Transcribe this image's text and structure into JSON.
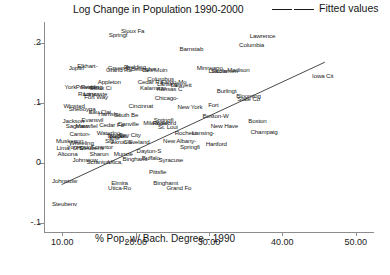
{
  "chart_data": {
    "type": "scatter",
    "title": "Log Change in Population 1990-2000",
    "xlabel": "% Pop. w/ Bach. Degree - 1990",
    "ylabel": "",
    "xlim": [
      7.5,
      52.5
    ],
    "ylim": [
      -0.115,
      0.235
    ],
    "xticks": [
      "10.00",
      "20.00",
      "30.00",
      "40.00",
      "50.00"
    ],
    "xtick_values": [
      10,
      20,
      30,
      40,
      50
    ],
    "yticks": [
      ".2",
      ".1",
      "0",
      "-.1"
    ],
    "ytick_values": [
      0.2,
      0.1,
      0,
      -0.1
    ],
    "grid": false,
    "legend_position": "top-right",
    "legend": [
      {
        "label": "Fitted values",
        "marker": "line"
      }
    ],
    "fit_line": {
      "label": "Fitted values",
      "x_start": 9.9,
      "y_start": -0.036,
      "x_end": 45.8,
      "y_end": 0.168
    },
    "point_label_field": "city",
    "points": [
      {
        "city": "Springf",
        "x": 17.6,
        "y": 0.215
      },
      {
        "city": "Sioux Fa",
        "x": 19.6,
        "y": 0.222
      },
      {
        "city": "Lawrence",
        "x": 37.3,
        "y": 0.213
      },
      {
        "city": "Columbia",
        "x": 35.8,
        "y": 0.199
      },
      {
        "city": "Barnstab",
        "x": 27.6,
        "y": 0.192
      },
      {
        "city": "Madison",
        "x": 34.0,
        "y": 0.157
      },
      {
        "city": "Iowa Cit",
        "x": 45.5,
        "y": 0.147
      },
      {
        "city": "Joplin",
        "x": 11.9,
        "y": 0.16
      },
      {
        "city": "Elkhart-",
        "x": 13.4,
        "y": 0.164
      },
      {
        "city": "Green B",
        "x": 17.7,
        "y": 0.16
      },
      {
        "city": "Grand Ra",
        "x": 17.7,
        "y": 0.156
      },
      {
        "city": "Redding",
        "x": 19.9,
        "y": 0.162
      },
      {
        "city": "Bellingha",
        "x": 21.0,
        "y": 0.159
      },
      {
        "city": "Des Moin",
        "x": 22.6,
        "y": 0.157
      },
      {
        "city": "Minneapo",
        "x": 30.1,
        "y": 0.16
      },
      {
        "city": "Lincoln",
        "x": 31.2,
        "y": 0.155
      },
      {
        "city": "Sacramen",
        "x": 32.1,
        "y": 0.155
      },
      {
        "city": "Appleton",
        "x": 16.4,
        "y": 0.136
      },
      {
        "city": "Cedar Ra",
        "x": 22.0,
        "y": 0.136
      },
      {
        "city": "Columbus",
        "x": 23.4,
        "y": 0.142
      },
      {
        "city": "Fargo-Mo",
        "x": 25.2,
        "y": 0.136
      },
      {
        "city": "Lansing",
        "x": 24.3,
        "y": 0.134
      },
      {
        "city": "York",
        "x": 11.1,
        "y": 0.128
      },
      {
        "city": "Providen",
        "x": 13.4,
        "y": 0.128
      },
      {
        "city": "Reading",
        "x": 14.0,
        "y": 0.128
      },
      {
        "city": "Sioux Ci",
        "x": 15.2,
        "y": 0.127
      },
      {
        "city": "Kalamazo",
        "x": 22.4,
        "y": 0.127
      },
      {
        "city": "Lafayett",
        "x": 26.2,
        "y": 0.131
      },
      {
        "city": "Kansas C",
        "x": 24.6,
        "y": 0.125
      },
      {
        "city": "Burlingt",
        "x": 32.4,
        "y": 0.122
      },
      {
        "city": "Lancaste",
        "x": 14.5,
        "y": 0.117
      },
      {
        "city": "Racine",
        "x": 13.4,
        "y": 0.117
      },
      {
        "city": "Fort Way",
        "x": 14.6,
        "y": 0.111
      },
      {
        "city": "Chicago-",
        "x": 24.2,
        "y": 0.11
      },
      {
        "city": "Blooming",
        "x": 35.4,
        "y": 0.114
      },
      {
        "city": "State Co",
        "x": 35.4,
        "y": 0.108
      },
      {
        "city": "Winsted",
        "x": 11.6,
        "y": 0.097
      },
      {
        "city": "Sheboyga",
        "x": 12.7,
        "y": 0.092
      },
      {
        "city": "Cincinnat",
        "x": 20.7,
        "y": 0.097
      },
      {
        "city": "New York",
        "x": 27.4,
        "y": 0.095
      },
      {
        "city": "Fort",
        "x": 30.6,
        "y": 0.099
      },
      {
        "city": "Eau Clai",
        "x": 15.1,
        "y": 0.086
      },
      {
        "city": "Harrisbu",
        "x": 16.4,
        "y": 0.084
      },
      {
        "city": "South Be",
        "x": 18.7,
        "y": 0.082
      },
      {
        "city": "Boston-W",
        "x": 30.9,
        "y": 0.08
      },
      {
        "city": "Jackson",
        "x": 11.5,
        "y": 0.072
      },
      {
        "city": "Evansvil",
        "x": 14.1,
        "y": 0.073
      },
      {
        "city": "Springfi",
        "x": 23.8,
        "y": 0.073
      },
      {
        "city": "Boston",
        "x": 36.6,
        "y": 0.072
      },
      {
        "city": "Saginaw",
        "x": 12.0,
        "y": 0.064
      },
      {
        "city": "Mansfiel",
        "x": 13.3,
        "y": 0.064
      },
      {
        "city": "Cedar Fa",
        "x": 16.7,
        "y": 0.065
      },
      {
        "city": "Danville",
        "x": 19.0,
        "y": 0.066
      },
      {
        "city": "Milwauke",
        "x": 22.7,
        "y": 0.068
      },
      {
        "city": "Rockford",
        "x": 23.9,
        "y": 0.069
      },
      {
        "city": "St. Loui",
        "x": 24.4,
        "y": 0.061
      },
      {
        "city": "New Have",
        "x": 32.1,
        "y": 0.063
      },
      {
        "city": "Canton-",
        "x": 12.4,
        "y": 0.05
      },
      {
        "city": "Waterloo",
        "x": 16.3,
        "y": 0.052
      },
      {
        "city": "Toledo",
        "x": 17.2,
        "y": 0.047
      },
      {
        "city": "Buffalo",
        "x": 17.6,
        "y": 0.047
      },
      {
        "city": "Bay City",
        "x": 19.2,
        "y": 0.049
      },
      {
        "city": "Rochest",
        "x": 26.8,
        "y": 0.051
      },
      {
        "city": "Lansing-",
        "x": 29.2,
        "y": 0.051
      },
      {
        "city": "Champaig",
        "x": 37.5,
        "y": 0.054
      },
      {
        "city": "Muskegon",
        "x": 11.0,
        "y": 0.038
      },
      {
        "city": "Wheeling",
        "x": 12.6,
        "y": 0.035
      },
      {
        "city": "Sig",
        "x": 16.4,
        "y": 0.038
      },
      {
        "city": "Erie",
        "x": 17.1,
        "y": 0.043
      },
      {
        "city": "Akron-S",
        "x": 18.1,
        "y": 0.037
      },
      {
        "city": "Cleveland",
        "x": 20.1,
        "y": 0.037
      },
      {
        "city": "New Albany-",
        "x": 26.0,
        "y": 0.038
      },
      {
        "city": "Hartford",
        "x": 31.0,
        "y": 0.033
      },
      {
        "city": "Lima, OH",
        "x": 10.9,
        "y": 0.027
      },
      {
        "city": "Youngsto",
        "x": 12.3,
        "y": 0.028
      },
      {
        "city": "Steubenv",
        "x": 14.0,
        "y": 0.027
      },
      {
        "city": "Scrantor",
        "x": 15.4,
        "y": 0.028
      },
      {
        "city": "Springfi",
        "x": 27.4,
        "y": 0.028
      },
      {
        "city": "Altoona",
        "x": 10.7,
        "y": 0.016
      },
      {
        "city": "Sharon",
        "x": 15.0,
        "y": 0.017
      },
      {
        "city": "Muncie",
        "x": 18.3,
        "y": 0.017
      },
      {
        "city": "Dayton-S",
        "x": 21.8,
        "y": 0.022
      },
      {
        "city": "Johnstow",
        "x": 13.1,
        "y": 0.007
      },
      {
        "city": "Binghamt",
        "x": 19.9,
        "y": 0.008
      },
      {
        "city": "Buffalo-",
        "x": 22.2,
        "y": 0.01
      },
      {
        "city": "Syracuse",
        "x": 24.8,
        "y": 0.007
      },
      {
        "city": "Scranton",
        "x": 14.9,
        "y": 0.004
      },
      {
        "city": "Utica,",
        "x": 17.2,
        "y": 0.003
      },
      {
        "city": "Pittsfie",
        "x": 23.0,
        "y": -0.014
      },
      {
        "city": "Johnstow",
        "x": 10.3,
        "y": -0.028
      },
      {
        "city": "Elmira",
        "x": 17.8,
        "y": -0.032
      },
      {
        "city": "Binghamt",
        "x": 24.1,
        "y": -0.031
      },
      {
        "city": "Utica-Ro",
        "x": 17.8,
        "y": -0.04
      },
      {
        "city": "Grand Fo",
        "x": 25.9,
        "y": -0.04
      },
      {
        "city": "Steubenv",
        "x": 10.3,
        "y": -0.066
      }
    ]
  }
}
